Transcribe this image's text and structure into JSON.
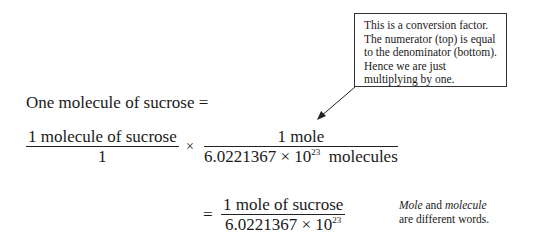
{
  "callout": {
    "lines": [
      "This is a conversion factor.",
      "The numerator (top) is equal",
      "to the denominator (bottom).",
      "Hence we are just",
      "multiplying by one."
    ]
  },
  "lead": "One molecule of sucrose  =",
  "fraction1": {
    "numerator": "1 molecule of sucrose",
    "denominator": "1"
  },
  "times": "×",
  "fraction2": {
    "numerator": "1 mole",
    "denominator_base": "6.0221367 × 10",
    "denominator_exp": "23",
    "denominator_unit": "  molecules"
  },
  "equals": "=",
  "fraction3": {
    "numerator": "1 mole of sucrose",
    "denominator_base": "6.0221367 × 10",
    "denominator_exp": "23"
  },
  "note": {
    "word1": "Mole",
    "mid": " and ",
    "word2": "molecule",
    "line2": "are different words."
  }
}
